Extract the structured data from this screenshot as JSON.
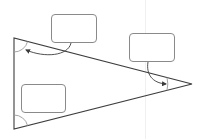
{
  "diagram": {
    "type": "triangle-angle-labels",
    "colors": {
      "triangle_stroke": "#3c3c3c",
      "arc_stroke": "#9a9a9a",
      "arrow_stroke": "#3c3c3c",
      "box_border": "#8a8a8a",
      "background": "#ffffff"
    },
    "triangle": {
      "vertices": {
        "top_left": [
          14,
          38
        ],
        "bottom_left": [
          14,
          129
        ],
        "right": [
          192,
          84
        ]
      }
    },
    "angles": [
      {
        "vertex": "top_left",
        "label": ""
      },
      {
        "vertex": "bottom_left",
        "label": ""
      },
      {
        "vertex": "right",
        "label": ""
      }
    ],
    "label_boxes": [
      {
        "id": "box-top",
        "text": "",
        "points_to": "top_left"
      },
      {
        "id": "box-right",
        "text": "",
        "points_to": "right"
      },
      {
        "id": "box-left",
        "text": "",
        "points_to": "bottom_left"
      }
    ]
  }
}
